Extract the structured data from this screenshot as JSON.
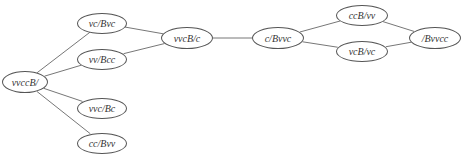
{
  "diagram": {
    "type": "graph",
    "node_border_color": "#555555",
    "edge_color": "#777777",
    "nodes": [
      {
        "id": "n0",
        "label": "vvccB/",
        "cx": 25,
        "cy": 82,
        "w": 46,
        "h": 22
      },
      {
        "id": "n1",
        "label": "vc/Bvc",
        "cx": 102,
        "cy": 23,
        "w": 50,
        "h": 21
      },
      {
        "id": "n2",
        "label": "vv/Bcc",
        "cx": 102,
        "cy": 59,
        "w": 50,
        "h": 21
      },
      {
        "id": "n3",
        "label": "vvc/Bc",
        "cx": 102,
        "cy": 108,
        "w": 50,
        "h": 21
      },
      {
        "id": "n4",
        "label": "cc/Bvv",
        "cx": 102,
        "cy": 143,
        "w": 50,
        "h": 21
      },
      {
        "id": "n5",
        "label": "vvcB/c",
        "cx": 187,
        "cy": 38,
        "w": 52,
        "h": 22
      },
      {
        "id": "n6",
        "label": "c/Bvvc",
        "cx": 278,
        "cy": 38,
        "w": 52,
        "h": 22
      },
      {
        "id": "n7",
        "label": "ccB/vv",
        "cx": 362,
        "cy": 15,
        "w": 52,
        "h": 21
      },
      {
        "id": "n8",
        "label": "vcB/vc",
        "cx": 362,
        "cy": 51,
        "w": 52,
        "h": 21
      },
      {
        "id": "n9",
        "label": "/Bvvcc",
        "cx": 435,
        "cy": 38,
        "w": 52,
        "h": 22
      }
    ],
    "edges": [
      {
        "from": "n0",
        "to": "n1"
      },
      {
        "from": "n0",
        "to": "n2"
      },
      {
        "from": "n0",
        "to": "n3"
      },
      {
        "from": "n0",
        "to": "n4"
      },
      {
        "from": "n1",
        "to": "n5"
      },
      {
        "from": "n2",
        "to": "n5"
      },
      {
        "from": "n5",
        "to": "n6"
      },
      {
        "from": "n6",
        "to": "n7"
      },
      {
        "from": "n6",
        "to": "n8"
      },
      {
        "from": "n7",
        "to": "n9"
      },
      {
        "from": "n8",
        "to": "n9"
      }
    ]
  }
}
